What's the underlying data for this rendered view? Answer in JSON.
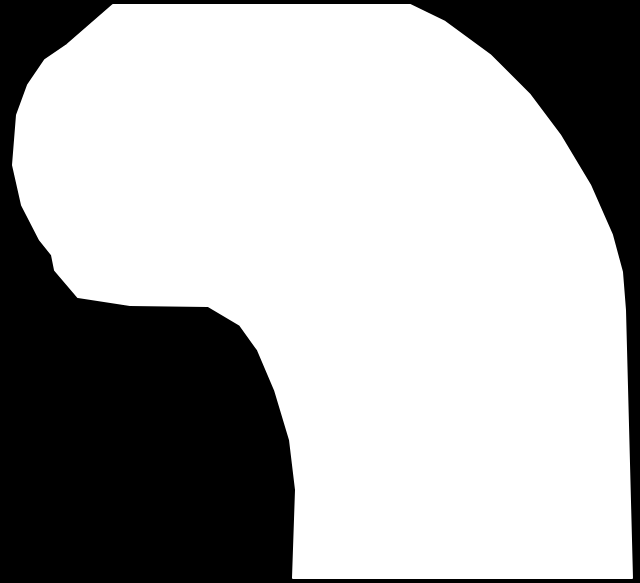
{
  "image": {
    "width": 640,
    "height": 583,
    "background_color": "#000000",
    "shape_color": "#ffffff",
    "shape": {
      "description": "white silhouette cutout",
      "outline_points": [
        [
          113,
          5
        ],
        [
          410,
          5
        ],
        [
          445,
          22
        ],
        [
          490,
          55
        ],
        [
          530,
          95
        ],
        [
          560,
          135
        ],
        [
          590,
          185
        ],
        [
          612,
          235
        ],
        [
          622,
          272
        ],
        [
          625,
          310
        ],
        [
          632,
          578
        ],
        [
          293,
          578
        ],
        [
          296,
          490
        ],
        [
          290,
          440
        ],
        [
          275,
          390
        ],
        [
          258,
          350
        ],
        [
          240,
          325
        ],
        [
          208,
          306
        ],
        [
          130,
          305
        ],
        [
          78,
          297
        ],
        [
          55,
          270
        ],
        [
          52,
          255
        ],
        [
          40,
          240
        ],
        [
          22,
          205
        ],
        [
          13,
          165
        ],
        [
          17,
          115
        ],
        [
          28,
          85
        ],
        [
          45,
          60
        ],
        [
          67,
          45
        ]
      ]
    }
  }
}
